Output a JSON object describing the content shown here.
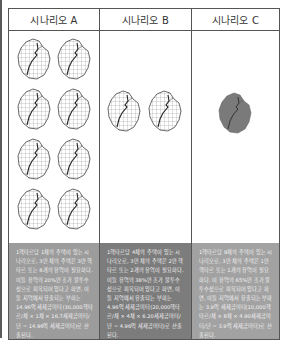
{
  "headers": [
    "시나리오 A",
    "시나리오 B",
    "시나리오 C"
  ],
  "colors": {
    "border": "#555555",
    "text_bg_a": "#9c9c9c",
    "text_bg_b": "#7c7c7c",
    "text_bg_c": "#a2a2a2",
    "leaf_fill_c": "#7a7a7a"
  },
  "scenarios": [
    {
      "label": "시나리오 A",
      "watershed_count": 8,
      "watershed_style": "grid",
      "description": "1헥타르당 1채의 주택이 있는 시나리오로, 3만 채의 주택은 3만 헥타르 또는 8개의 유역이 필요하다. 이들 유역의 20%만 조가 불투수성으로 피복되어 있다고 하면, 이들 지역에서 유출되는 부하는 14.96억 세제곱미터(30,000헥타르/채 × 1채 × 16.7세제곱미터/년 = 14.96억 세제곱미터)로 산출된다."
    },
    {
      "label": "시나리오 B",
      "watershed_count": 2,
      "watershed_style": "grid",
      "description": "1헥타르당 4채의 주택이 있는 시나리오로, 3만 채의 주택은 2만 헥타르 또는 2개의 유역이 필요하다. 이들 유역의 38%만 조가 불투수성으로 피복되어 있다고 하면, 이들 지역에서 유출되는 부하는 4.96억 세제곱미터(20,000헥타르/채 × 4채 × 6.20세제곱미터/년 = 4.96억 세제곱미터)로 산출된다."
    },
    {
      "label": "시나리오 C",
      "watershed_count": 1,
      "watershed_style": "solid",
      "description": "1헥타르당 8채의 주택이 있는 시나리오로, 3만 채의 주택은 1만 헥타르 또는 1개의 유역이 필요하다. 이 유역의 65%만 조가 불투수성으로 피복되어 있다고 하면, 이들 지역에서 유출되는 부하는 3.9억 세제곱미터(10,000헥타르/채 × 8채 × 4.90세제곱미터/년 = 3.9억 세제곱미터)로 산출된다."
    }
  ]
}
